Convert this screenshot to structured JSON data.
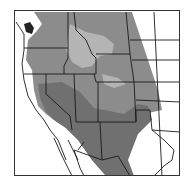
{
  "map": {
    "title": "",
    "region": "Western North America range map",
    "colors": {
      "background": "#ffffff",
      "range_main": "#8c8c8c",
      "range_light": "#b4b4b4",
      "range_dark": "#707070",
      "borders": "#1a1a1a",
      "frame": "#333333"
    },
    "legend": []
  }
}
